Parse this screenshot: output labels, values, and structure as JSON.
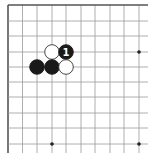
{
  "board": {
    "description": "Go board fragment, top-left corner region",
    "size_shown": {
      "cols": 10,
      "rows": 10
    },
    "edges": {
      "top": true,
      "left": true,
      "right": false,
      "bottom": false
    },
    "colors": {
      "background": "#ffffff",
      "line": "#9a9a9a",
      "border": "#555555",
      "black_stone": "#1a1a1a",
      "white_stone": "#ffffff",
      "white_outline": "#333333",
      "label_on_black": "#ffffff"
    },
    "hoshi": [
      {
        "col": 9,
        "row": 3
      },
      {
        "col": 3,
        "row": 9
      },
      {
        "col": 9,
        "row": 9
      }
    ],
    "stones": [
      {
        "color": "white",
        "col": 3,
        "row": 3,
        "label": ""
      },
      {
        "color": "black",
        "col": 4,
        "row": 3,
        "label": "1"
      },
      {
        "color": "black",
        "col": 2,
        "row": 4,
        "label": ""
      },
      {
        "color": "black",
        "col": 3,
        "row": 4,
        "label": ""
      },
      {
        "color": "white",
        "col": 4,
        "row": 4,
        "label": ""
      }
    ]
  }
}
